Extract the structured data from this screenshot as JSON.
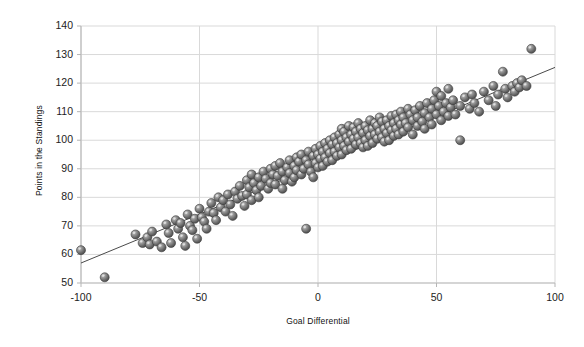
{
  "chart_data": {
    "type": "scatter",
    "title": "",
    "xlabel": "Goal Differential",
    "ylabel": "Points in the Standings",
    "xlim": [
      -100,
      100
    ],
    "ylim": [
      50,
      140
    ],
    "xticks": [
      -100,
      -50,
      0,
      50,
      100
    ],
    "yticks": [
      50,
      60,
      70,
      80,
      90,
      100,
      110,
      120,
      130,
      140
    ],
    "xtick_labels": [
      "-100",
      "-50",
      "0",
      "50",
      "100"
    ],
    "ytick_labels": [
      "50",
      "60",
      "70",
      "80",
      "90",
      "100",
      "110",
      "120",
      "130",
      "140"
    ],
    "grid": {
      "horizontal": true,
      "vertical": true,
      "color": "#d9d9d9"
    },
    "legend": null,
    "marker": {
      "style": "3d-sphere",
      "color": "#666666",
      "edge_color": "#3a3a3a",
      "highlight_color": "#cfcfcf",
      "diameter_px": 9
    },
    "trendline": {
      "type": "linear",
      "color": "#4a4a4a",
      "width_px": 1,
      "x_start": -100,
      "y_start": 57,
      "x_end": 100,
      "y_end": 125.5
    },
    "series": [
      {
        "name": "Teams",
        "points": [
          [
            -100,
            61.5
          ],
          [
            -90,
            52
          ],
          [
            -77,
            67
          ],
          [
            -74,
            64
          ],
          [
            -72,
            66
          ],
          [
            -71,
            63.5
          ],
          [
            -70,
            68
          ],
          [
            -68,
            64.5
          ],
          [
            -66,
            62.5
          ],
          [
            -64,
            70.5
          ],
          [
            -63,
            67.5
          ],
          [
            -62,
            64
          ],
          [
            -60,
            72
          ],
          [
            -59,
            69
          ],
          [
            -58,
            71
          ],
          [
            -57,
            66
          ],
          [
            -56,
            63
          ],
          [
            -55,
            74
          ],
          [
            -54,
            70
          ],
          [
            -53,
            68.5
          ],
          [
            -52,
            72.5
          ],
          [
            -51,
            65.5
          ],
          [
            -50,
            76
          ],
          [
            -49,
            73
          ],
          [
            -48,
            71.5
          ],
          [
            -47,
            69
          ],
          [
            -46,
            75
          ],
          [
            -45,
            78
          ],
          [
            -44,
            74.5
          ],
          [
            -43,
            72
          ],
          [
            -42,
            80
          ],
          [
            -41,
            76.5
          ],
          [
            -40,
            79
          ],
          [
            -39,
            75
          ],
          [
            -38,
            81
          ],
          [
            -37,
            77.5
          ],
          [
            -36,
            73.5
          ],
          [
            -35,
            82
          ],
          [
            -34,
            79.5
          ],
          [
            -33,
            84
          ],
          [
            -32,
            80.5
          ],
          [
            -31,
            77
          ],
          [
            -30,
            86
          ],
          [
            -30,
            81
          ],
          [
            -29,
            83.5
          ],
          [
            -28,
            79
          ],
          [
            -28,
            88
          ],
          [
            -27,
            85
          ],
          [
            -26,
            82.5
          ],
          [
            -25,
            87
          ],
          [
            -25,
            80
          ],
          [
            -24,
            84
          ],
          [
            -23,
            89
          ],
          [
            -22,
            86.5
          ],
          [
            -21,
            83
          ],
          [
            -20,
            90
          ],
          [
            -20,
            85
          ],
          [
            -19,
            88
          ],
          [
            -18,
            91
          ],
          [
            -18,
            84.5
          ],
          [
            -17,
            87.5
          ],
          [
            -16,
            92
          ],
          [
            -15,
            89
          ],
          [
            -15,
            83
          ],
          [
            -14,
            86
          ],
          [
            -13,
            90.5
          ],
          [
            -12,
            88.5
          ],
          [
            -12,
            93
          ],
          [
            -11,
            85.5
          ],
          [
            -10,
            91
          ],
          [
            -10,
            87
          ],
          [
            -9,
            94
          ],
          [
            -9,
            89.5
          ],
          [
            -8,
            92.5
          ],
          [
            -7,
            88
          ],
          [
            -7,
            95
          ],
          [
            -6,
            90
          ],
          [
            -5,
            93
          ],
          [
            -5,
            69
          ],
          [
            -4,
            96
          ],
          [
            -4,
            91.5
          ],
          [
            -3,
            89
          ],
          [
            -2,
            94.5
          ],
          [
            -2,
            87
          ],
          [
            -1,
            92
          ],
          [
            -1,
            97
          ],
          [
            0,
            95
          ],
          [
            0,
            90.5
          ],
          [
            1,
            98
          ],
          [
            1,
            93.5
          ],
          [
            2,
            96
          ],
          [
            2,
            91
          ],
          [
            3,
            99
          ],
          [
            3,
            94
          ],
          [
            4,
            97
          ],
          [
            4,
            92.5
          ],
          [
            5,
            100
          ],
          [
            5,
            95.5
          ],
          [
            6,
            98.5
          ],
          [
            6,
            93
          ],
          [
            7,
            101
          ],
          [
            7,
            96
          ],
          [
            8,
            99
          ],
          [
            8,
            94.5
          ],
          [
            9,
            102
          ],
          [
            9,
            97.5
          ],
          [
            10,
            100
          ],
          [
            10,
            95
          ],
          [
            10,
            104
          ],
          [
            11,
            98
          ],
          [
            11,
            103
          ],
          [
            12,
            101
          ],
          [
            12,
            96.5
          ],
          [
            13,
            99.5
          ],
          [
            13,
            105
          ],
          [
            14,
            102
          ],
          [
            14,
            97
          ],
          [
            15,
            100.5
          ],
          [
            15,
            104.5
          ],
          [
            16,
            98.5
          ],
          [
            16,
            103
          ],
          [
            17,
            101
          ],
          [
            17,
            106
          ],
          [
            18,
            99
          ],
          [
            18,
            104
          ],
          [
            19,
            102.5
          ],
          [
            19,
            97.5
          ],
          [
            20,
            100
          ],
          [
            20,
            105
          ],
          [
            21,
            103.5
          ],
          [
            21,
            98
          ],
          [
            22,
            101.5
          ],
          [
            22,
            107
          ],
          [
            23,
            104
          ],
          [
            23,
            99
          ],
          [
            24,
            102
          ],
          [
            24,
            106
          ],
          [
            25,
            100.5
          ],
          [
            25,
            105
          ],
          [
            26,
            103
          ],
          [
            26,
            108
          ],
          [
            27,
            101
          ],
          [
            27,
            106.5
          ],
          [
            28,
            104
          ],
          [
            28,
            99.5
          ],
          [
            29,
            102.5
          ],
          [
            29,
            107
          ],
          [
            30,
            105
          ],
          [
            30,
            100
          ],
          [
            31,
            103.5
          ],
          [
            31,
            108.5
          ],
          [
            32,
            106
          ],
          [
            32,
            101.5
          ],
          [
            33,
            104
          ],
          [
            33,
            109
          ],
          [
            34,
            107
          ],
          [
            34,
            102
          ],
          [
            35,
            105.5
          ],
          [
            35,
            110
          ],
          [
            36,
            103
          ],
          [
            36,
            108
          ],
          [
            37,
            106
          ],
          [
            38,
            111
          ],
          [
            38,
            104.5
          ],
          [
            39,
            109
          ],
          [
            40,
            107
          ],
          [
            40,
            102
          ],
          [
            41,
            110.5
          ],
          [
            42,
            105
          ],
          [
            42,
            108
          ],
          [
            43,
            112
          ],
          [
            44,
            106.5
          ],
          [
            45,
            109.5
          ],
          [
            45,
            104
          ],
          [
            46,
            113
          ],
          [
            47,
            108
          ],
          [
            48,
            111
          ],
          [
            48,
            105.5
          ],
          [
            49,
            114
          ],
          [
            50,
            109
          ],
          [
            50,
            117
          ],
          [
            51,
            112
          ],
          [
            52,
            107
          ],
          [
            52,
            115.5
          ],
          [
            53,
            110
          ],
          [
            54,
            113
          ],
          [
            55,
            108.5
          ],
          [
            55,
            118
          ],
          [
            56,
            111.5
          ],
          [
            57,
            114
          ],
          [
            58,
            109
          ],
          [
            60,
            112
          ],
          [
            60,
            100
          ],
          [
            62,
            115
          ],
          [
            64,
            111
          ],
          [
            65,
            116
          ],
          [
            66,
            113
          ],
          [
            68,
            110
          ],
          [
            70,
            117
          ],
          [
            72,
            114
          ],
          [
            74,
            119
          ],
          [
            75,
            112
          ],
          [
            76,
            116
          ],
          [
            78,
            124
          ],
          [
            79,
            118
          ],
          [
            80,
            115
          ],
          [
            82,
            119
          ],
          [
            83,
            117
          ],
          [
            84,
            120
          ],
          [
            85,
            118.5
          ],
          [
            86,
            121
          ],
          [
            88,
            119
          ],
          [
            90,
            132
          ]
        ]
      }
    ]
  }
}
